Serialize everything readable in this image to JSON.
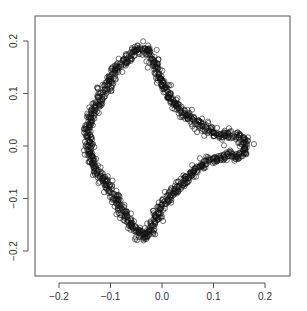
{
  "chart_data": {
    "type": "scatter",
    "title": "",
    "xlabel": "",
    "ylabel": "",
    "xlim": [
      -0.245,
      0.25
    ],
    "ylim": [
      -0.25,
      0.245
    ],
    "grid": false,
    "legend": null,
    "marker": "open-circle",
    "x_ticks": [
      -0.2,
      -0.1,
      0.0,
      0.1,
      0.2
    ],
    "x_tick_labels": [
      "-0.2",
      "-0.1",
      "0.0",
      "0.1",
      "0.2"
    ],
    "y_ticks": [
      -0.2,
      -0.1,
      0.0,
      0.1,
      0.2
    ],
    "y_tick_labels": [
      "-0.2",
      "-0.1",
      "0.0",
      "0.1",
      "0.2"
    ],
    "outline": {
      "x": [
        -0.03,
        -0.015,
        -0.005,
        0.01,
        0.03,
        0.055,
        0.08,
        0.1,
        0.12,
        0.14,
        0.155,
        0.163,
        0.16,
        0.145,
        0.125,
        0.1,
        0.075,
        0.05,
        0.025,
        0.0,
        -0.015,
        -0.03,
        -0.045,
        -0.06,
        -0.08,
        -0.1,
        -0.12,
        -0.135,
        -0.142,
        -0.145,
        -0.14,
        -0.13,
        -0.115,
        -0.1,
        -0.085,
        -0.065,
        -0.045,
        -0.03
      ],
      "y": [
        0.185,
        0.16,
        0.13,
        0.1,
        0.075,
        0.052,
        0.035,
        0.025,
        0.022,
        0.02,
        0.015,
        0.002,
        -0.012,
        -0.018,
        -0.018,
        -0.025,
        -0.038,
        -0.058,
        -0.085,
        -0.115,
        -0.145,
        -0.175,
        -0.17,
        -0.15,
        -0.12,
        -0.085,
        -0.055,
        -0.03,
        -0.005,
        0.025,
        0.05,
        0.075,
        0.1,
        0.125,
        0.15,
        0.17,
        0.185,
        0.185
      ]
    }
  }
}
